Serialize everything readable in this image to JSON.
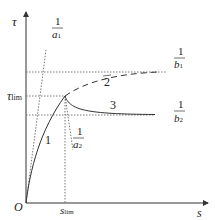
{
  "diagram": {
    "axes": {
      "y_label": "τ",
      "x_label": "s",
      "origin_label": "O"
    },
    "ticks": {
      "tau_lim_main": "τ",
      "tau_lim_sub": "lim",
      "s_lim_main": "s",
      "s_lim_sub": "lim"
    },
    "slopes": {
      "a1": {
        "num": "1",
        "den": "a",
        "den_sub": "1"
      },
      "a2": {
        "num": "1",
        "den": "a",
        "den_sub": "2"
      }
    },
    "asymptotes": {
      "b1": {
        "num": "1",
        "den": "b",
        "den_sub": "1"
      },
      "b2": {
        "num": "1",
        "den": "b",
        "den_sub": "2"
      }
    },
    "curves": [
      {
        "label": "1",
        "style": "solid",
        "desc": "rising hyperbolic curve from origin to peak"
      },
      {
        "label": "2",
        "style": "dashed",
        "desc": "continuation approaching 1/b1"
      },
      {
        "label": "3",
        "style": "solid",
        "desc": "softening branch approaching 1/b2"
      }
    ],
    "colors": {
      "line": "#333333",
      "dotted": "#555555"
    }
  }
}
